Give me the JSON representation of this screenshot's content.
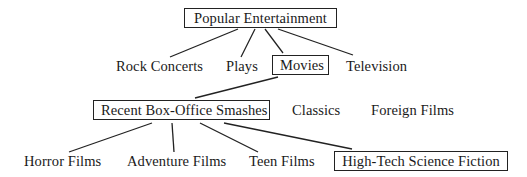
{
  "diagram": {
    "type": "hierarchy-tree",
    "nodes": {
      "root": {
        "label": "Popular Entertainment",
        "boxed": true
      },
      "rock_concerts": {
        "label": "Rock Concerts",
        "boxed": false
      },
      "plays": {
        "label": "Plays",
        "boxed": false
      },
      "movies": {
        "label": "Movies",
        "boxed": true
      },
      "television": {
        "label": "Television",
        "boxed": false
      },
      "recent_box_office": {
        "label": "Recent Box-Office Smashes",
        "boxed": true
      },
      "classics": {
        "label": "Classics",
        "boxed": false
      },
      "foreign_films": {
        "label": "Foreign Films",
        "boxed": false
      },
      "horror_films": {
        "label": "Horror Films",
        "boxed": false
      },
      "adventure_films": {
        "label": "Adventure Films",
        "boxed": false
      },
      "teen_films": {
        "label": "Teen Films",
        "boxed": false
      },
      "high_tech_sci_fi": {
        "label": "High-Tech Science Fiction",
        "boxed": true
      }
    },
    "edges": [
      [
        "root",
        "rock_concerts"
      ],
      [
        "root",
        "plays"
      ],
      [
        "root",
        "movies"
      ],
      [
        "root",
        "television"
      ],
      [
        "movies",
        "recent_box_office"
      ],
      [
        "recent_box_office",
        "horror_films"
      ],
      [
        "recent_box_office",
        "adventure_films"
      ],
      [
        "recent_box_office",
        "teen_films"
      ],
      [
        "recent_box_office",
        "high_tech_sci_fi"
      ]
    ],
    "line_color": "#222222"
  }
}
